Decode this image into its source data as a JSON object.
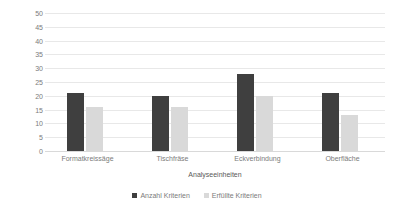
{
  "chart_data": {
    "type": "bar",
    "title": "",
    "subtitle": "",
    "xlabel": "Analyseeinheiten",
    "ylabel": "Kriterienanzahl",
    "categories": [
      "Formatkreissäge",
      "Tischfräse",
      "Eckverbindung",
      "Oberfläche"
    ],
    "series": [
      {
        "name": "Anzahl Kriterien",
        "color": "#3f3f3f",
        "values": [
          21,
          20,
          28,
          21
        ]
      },
      {
        "name": "Erfüllte Kriterien",
        "color": "#d9d9d9",
        "values": [
          16,
          16,
          20,
          13
        ]
      }
    ],
    "ylim": [
      0,
      50
    ],
    "ytick_step": 5,
    "yticks": [
      0,
      5,
      10,
      15,
      20,
      25,
      30,
      35,
      40,
      45,
      50
    ],
    "ytick_labels": [
      "0",
      "5",
      "10",
      "15",
      "20",
      "25",
      "30",
      "35",
      "40",
      "45",
      "50"
    ],
    "grid": "horizontal",
    "legend_position": "bottom",
    "background": "#ffffff",
    "gridline_color": "#e8e8e8",
    "text_color": "#7b7b7b"
  }
}
